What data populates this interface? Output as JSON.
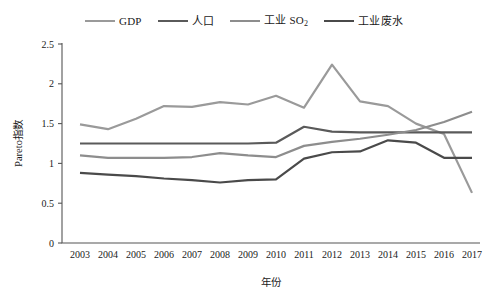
{
  "chart_data": {
    "type": "line",
    "title": "",
    "xlabel": "年份",
    "ylabel": "Pareto指数",
    "x": [
      2003,
      2004,
      2005,
      2006,
      2007,
      2008,
      2009,
      2010,
      2011,
      2012,
      2013,
      2014,
      2015,
      2016,
      2017
    ],
    "xtick_labels": [
      "2003",
      "2004",
      "2005",
      "2006",
      "2007",
      "2008",
      "2009",
      "2010",
      "2011",
      "2012",
      "2013",
      "2014",
      "2015",
      "2016",
      "2017"
    ],
    "ytick_labels": [
      "0",
      "0.5",
      "1",
      "1.5",
      "2",
      "2.5"
    ],
    "ytick_values": [
      0,
      0.5,
      1,
      1.5,
      2,
      2.5
    ],
    "ylim": [
      0,
      2.5
    ],
    "xlim": [
      2003,
      2017
    ],
    "grid": false,
    "legend_position": "top-center",
    "series": [
      {
        "name": "GDP",
        "color": "#9a9a9a",
        "values": [
          1.49,
          1.43,
          1.56,
          1.72,
          1.71,
          1.77,
          1.74,
          1.85,
          1.7,
          2.24,
          1.78,
          1.72,
          1.5,
          1.37,
          0.63
        ]
      },
      {
        "name": "人口",
        "color": "#5a5a5a",
        "values": [
          1.25,
          1.25,
          1.25,
          1.25,
          1.25,
          1.25,
          1.25,
          1.26,
          1.46,
          1.4,
          1.39,
          1.39,
          1.39,
          1.39,
          1.39
        ]
      },
      {
        "name": "工业 SO₂",
        "color": "#8d8d8d",
        "values": [
          1.1,
          1.07,
          1.07,
          1.07,
          1.08,
          1.13,
          1.1,
          1.08,
          1.22,
          1.27,
          1.31,
          1.36,
          1.42,
          1.52,
          1.65
        ]
      },
      {
        "name": "工业废水",
        "color": "#4a4a4a",
        "values": [
          0.88,
          0.86,
          0.84,
          0.81,
          0.79,
          0.76,
          0.79,
          0.8,
          1.06,
          1.14,
          1.15,
          1.29,
          1.26,
          1.07,
          1.07
        ]
      }
    ]
  },
  "legend": {
    "items": [
      {
        "label": "GDP",
        "sub": "",
        "color": "#9a9a9a"
      },
      {
        "label": "人口",
        "sub": "",
        "color": "#5a5a5a"
      },
      {
        "label": "工业 SO",
        "sub": "2",
        "color": "#8d8d8d"
      },
      {
        "label": "工业废水",
        "sub": "",
        "color": "#4a4a4a"
      }
    ]
  }
}
